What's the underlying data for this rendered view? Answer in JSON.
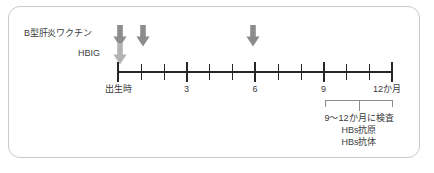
{
  "diagram": {
    "title_text": "",
    "colors": {
      "frame_border": "#c9c9c9",
      "axis": "#262626",
      "text": "#3a3a3a",
      "arrow_vaccine": "#8c8c8c",
      "arrow_hbig": "#b4b4b4",
      "bracket": "#8d8d8d",
      "background": "#ffffff"
    },
    "rows": [
      {
        "label": "B型肝炎ワクチン",
        "icon": "down-arrow-icon"
      },
      {
        "label": "HBIG",
        "icon": "down-arrow-icon"
      }
    ],
    "arrows": [
      {
        "series": "vaccine",
        "month": 0,
        "icon": "down-arrow-icon"
      },
      {
        "series": "vaccine",
        "month": 1,
        "icon": "down-arrow-icon"
      },
      {
        "series": "vaccine",
        "month": 6,
        "icon": "down-arrow-icon"
      },
      {
        "series": "hbig",
        "month": 0,
        "icon": "down-arrow-icon"
      }
    ],
    "axis": {
      "labels": [
        {
          "month": 0,
          "text": "出生時"
        },
        {
          "month": 3,
          "text": "3"
        },
        {
          "month": 6,
          "text": "6"
        },
        {
          "month": 9,
          "text": "9"
        },
        {
          "month": 12,
          "text": "12か月"
        }
      ],
      "tick_months": [
        0,
        1,
        2,
        3,
        4,
        5,
        6,
        7,
        8,
        9,
        10,
        11,
        12
      ],
      "major_tick_months": [
        0,
        3,
        6,
        9,
        12
      ],
      "range": [
        0,
        12
      ],
      "unit": "か月"
    },
    "bracket": {
      "start_month": 9,
      "end_month": 12,
      "notes": [
        "9〜12か月に検査",
        "HBs抗原",
        "HBs抗体"
      ]
    }
  },
  "chart_data": {
    "type": "table",
    "xlabel": "か月",
    "ylabel": "",
    "xlim": [
      0,
      12
    ],
    "grid": false,
    "legend": "left-labels",
    "categories": [
      "出生時",
      "3",
      "6",
      "9",
      "12か月"
    ],
    "series": [
      {
        "name": "B型肝炎ワクチン",
        "x": [
          0,
          1,
          6
        ],
        "marker": "down-arrow"
      },
      {
        "name": "HBIG",
        "x": [
          0
        ],
        "marker": "down-arrow"
      }
    ],
    "annotations": [
      {
        "type": "bracket",
        "x_start": 9,
        "x_end": 12,
        "text": "9〜12か月に検査 / HBs抗原 / HBs抗体"
      }
    ]
  }
}
